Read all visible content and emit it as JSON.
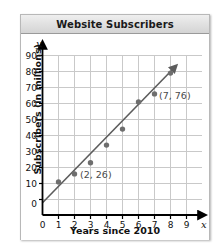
{
  "card": {
    "title": "Website Subscribers"
  },
  "chart_data": {
    "type": "scatter",
    "title": "Website Subscribers",
    "xlabel": "Years since 2010",
    "ylabel": "Subscribers (in millions)",
    "x_axis_symbol": "x",
    "y_axis_symbol": "y",
    "xlim": [
      0,
      9
    ],
    "ylim": [
      0,
      90
    ],
    "grid": true,
    "legend": "none",
    "x_ticks": [
      "0",
      "1",
      "2",
      "3",
      "4",
      "5",
      "6",
      "7",
      "8",
      "9"
    ],
    "y_ticks": [
      "0",
      "10",
      "20",
      "30",
      "40",
      "50",
      "60",
      "70",
      "80",
      "90"
    ],
    "points": [
      {
        "x": 1,
        "y": 21
      },
      {
        "x": 2,
        "y": 26
      },
      {
        "x": 3,
        "y": 33
      },
      {
        "x": 4,
        "y": 44
      },
      {
        "x": 5,
        "y": 54
      },
      {
        "x": 6,
        "y": 71
      },
      {
        "x": 7,
        "y": 76
      },
      {
        "x": 8,
        "y": 89
      }
    ],
    "annotations": [
      {
        "text": "(2, 26)",
        "x": 2,
        "y": 26
      },
      {
        "text": "(7, 76)",
        "x": 7,
        "y": 76
      }
    ],
    "trend_line": {
      "from": {
        "x": 0,
        "y": 8
      },
      "to": {
        "x": 9,
        "y": 100
      },
      "arrow": true
    },
    "point_color": "#6e6e6e",
    "line_color": "#5c5c5c",
    "grid_color": "#c9c9c9",
    "axis_color": "#000000"
  }
}
